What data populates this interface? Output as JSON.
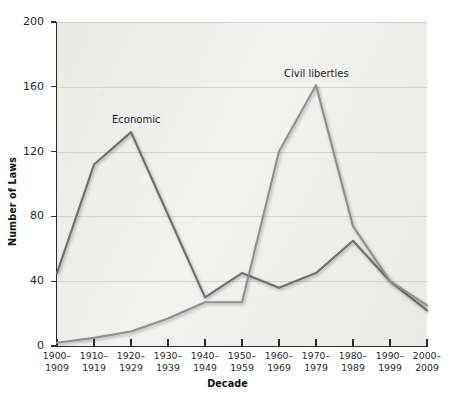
{
  "chart_data": {
    "type": "line",
    "title": "",
    "xlabel": "Decade",
    "ylabel": "Number of Laws",
    "categories": [
      "1900–\n1909",
      "1910–\n1919",
      "1920–\n1929",
      "1930–\n1939",
      "1940–\n1949",
      "1950–\n1959",
      "1960–\n1969",
      "1970–\n1979",
      "1980–\n1989",
      "1990–\n1999",
      "2000–\n2009"
    ],
    "series": [
      {
        "name": "Economic",
        "color": "#6e6e6e",
        "values": [
          45,
          112,
          132,
          81,
          30,
          45,
          36,
          45,
          65,
          40,
          22
        ]
      },
      {
        "name": "Civil liberties",
        "color": "#8f8f8f",
        "values": [
          2,
          5,
          9,
          17,
          27,
          27,
          120,
          161,
          74,
          40,
          25
        ]
      }
    ],
    "ylim": [
      0,
      200
    ],
    "yticks": [
      0,
      40,
      80,
      120,
      160,
      200
    ],
    "ytick_labels": [
      "0",
      "40",
      "80",
      "120",
      "160",
      "200"
    ],
    "grid": "horizontal",
    "legend": "inline-annotations",
    "annotations": [
      {
        "text": "Economic",
        "series": "Economic"
      },
      {
        "text": "Civil liberties",
        "series": "Civil liberties"
      }
    ]
  },
  "axes": {
    "y_title": "Number of Laws",
    "x_title": "Decade"
  },
  "colors": {
    "plot_background": "#eeeeec",
    "gridline": "#d2d2cf",
    "axis": "#2b2b2b",
    "economic_line": "#6e6e6e",
    "civil_liberties_line": "#8f8f8f"
  }
}
